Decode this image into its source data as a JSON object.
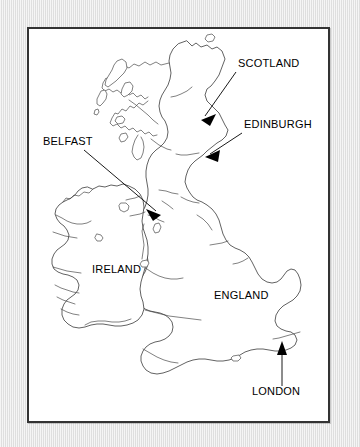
{
  "figure": {
    "kind": "outline-map",
    "region": "British Isles",
    "frame_color": "#333333",
    "panel_color": "#ffffff",
    "background_color": "#e9e9e9",
    "coastline_color": "#3a3a3a",
    "annotation_color": "#000000"
  },
  "labels": [
    {
      "id": "scotland",
      "text": "SCOTLAND",
      "text_x": 209,
      "text_y": 38,
      "anchor": "start",
      "has_arrow": true,
      "arrow_from_x": 207,
      "arrow_from_y": 43,
      "arrow_to_x": 172,
      "arrow_to_y": 91,
      "target": "Scottish Highlands"
    },
    {
      "id": "edinburgh",
      "text": "EDINBURGH",
      "text_x": 215,
      "text_y": 99,
      "anchor": "start",
      "has_arrow": true,
      "arrow_from_x": 213,
      "arrow_from_y": 104,
      "arrow_to_x": 177,
      "arrow_to_y": 128,
      "target": "Edinburgh, east-central Scotland"
    },
    {
      "id": "belfast",
      "text": "BELFAST",
      "text_x": 14,
      "text_y": 116,
      "anchor": "start",
      "has_arrow": true,
      "arrow_from_x": 55,
      "arrow_from_y": 121,
      "arrow_to_x": 132,
      "arrow_to_y": 186,
      "target": "Belfast, Northern Ireland"
    },
    {
      "id": "ireland",
      "text": "IRELAND",
      "text_x": 63,
      "text_y": 244,
      "anchor": "start",
      "has_arrow": false,
      "target": "Island of Ireland"
    },
    {
      "id": "england",
      "text": "ENGLAND",
      "text_x": 185,
      "text_y": 270,
      "anchor": "start",
      "has_arrow": false,
      "target": "England"
    },
    {
      "id": "london",
      "text": "LONDON",
      "text_x": 223,
      "text_y": 366,
      "anchor": "start",
      "has_arrow": true,
      "arrow_from_x": 253,
      "arrow_from_y": 357,
      "arrow_to_x": 253,
      "arrow_to_y": 318,
      "target": "London, south-east England"
    }
  ]
}
